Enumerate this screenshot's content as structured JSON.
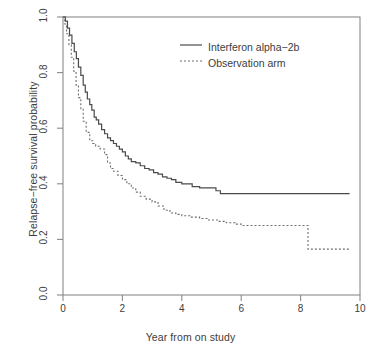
{
  "chart_data": {
    "type": "line",
    "title": "",
    "xlabel": "Year from on study",
    "ylabel": "Relapse-free survival probability",
    "xlim": [
      0,
      10
    ],
    "ylim": [
      0.0,
      1.0
    ],
    "grid": false,
    "step_style": "post",
    "legend_position": "top-center",
    "xticks": [
      0,
      2,
      4,
      6,
      8,
      10
    ],
    "xtick_labels": [
      "0",
      "2",
      "4",
      "6",
      "8",
      "10"
    ],
    "yticks": [
      0.0,
      0.2,
      0.4,
      0.6,
      0.8,
      1.0
    ],
    "ytick_labels": [
      "0.0",
      "0.2",
      "0.4",
      "0.6",
      "0.8",
      "1.0"
    ],
    "series": [
      {
        "name": "Interferon alpha-2b",
        "style": "solid",
        "color": "#4a4a4a",
        "x": [
          0,
          0.08,
          0.15,
          0.22,
          0.3,
          0.38,
          0.45,
          0.52,
          0.6,
          0.68,
          0.75,
          0.82,
          0.9,
          0.97,
          1.05,
          1.12,
          1.2,
          1.3,
          1.4,
          1.5,
          1.6,
          1.7,
          1.8,
          1.9,
          2.0,
          2.1,
          2.2,
          2.3,
          2.45,
          2.6,
          2.75,
          2.9,
          3.05,
          3.2,
          3.35,
          3.5,
          3.65,
          3.8,
          4.0,
          4.2,
          4.35,
          4.6,
          4.9,
          5.15,
          5.3,
          6.0,
          7.0,
          8.0,
          9.0,
          9.65
        ],
        "y": [
          1.0,
          0.985,
          0.96,
          0.935,
          0.905,
          0.875,
          0.85,
          0.82,
          0.79,
          0.755,
          0.73,
          0.705,
          0.685,
          0.665,
          0.64,
          0.63,
          0.615,
          0.595,
          0.58,
          0.565,
          0.555,
          0.545,
          0.535,
          0.525,
          0.515,
          0.5,
          0.49,
          0.48,
          0.475,
          0.465,
          0.455,
          0.45,
          0.44,
          0.435,
          0.425,
          0.42,
          0.415,
          0.405,
          0.4,
          0.4,
          0.39,
          0.385,
          0.385,
          0.375,
          0.365,
          0.365,
          0.365,
          0.365,
          0.365,
          0.365
        ]
      },
      {
        "name": "Observation arm",
        "style": "dashed",
        "color": "#6d6d6d",
        "x": [
          0,
          0.06,
          0.12,
          0.2,
          0.28,
          0.36,
          0.44,
          0.52,
          0.6,
          0.68,
          0.78,
          0.9,
          1.0,
          1.1,
          1.25,
          1.4,
          1.5,
          1.6,
          1.7,
          1.85,
          2.0,
          2.15,
          2.3,
          2.45,
          2.6,
          2.8,
          3.0,
          3.2,
          3.4,
          3.6,
          3.8,
          4.0,
          4.3,
          4.6,
          4.9,
          5.2,
          5.5,
          5.8,
          6.0,
          6.5,
          7.0,
          7.5,
          8.0,
          8.25,
          8.6,
          9.0,
          9.4,
          9.65
        ],
        "y": [
          1.0,
          0.975,
          0.94,
          0.9,
          0.855,
          0.805,
          0.755,
          0.71,
          0.67,
          0.625,
          0.585,
          0.555,
          0.545,
          0.535,
          0.525,
          0.505,
          0.475,
          0.455,
          0.445,
          0.43,
          0.415,
          0.4,
          0.385,
          0.37,
          0.355,
          0.345,
          0.335,
          0.32,
          0.305,
          0.295,
          0.29,
          0.285,
          0.28,
          0.275,
          0.27,
          0.265,
          0.26,
          0.255,
          0.25,
          0.25,
          0.25,
          0.25,
          0.25,
          0.165,
          0.165,
          0.165,
          0.165,
          0.165
        ]
      }
    ]
  },
  "legend": {
    "entries": [
      {
        "label": "Interferon alpha−2b",
        "style": "solid"
      },
      {
        "label": "Observation arm",
        "style": "dashed"
      }
    ]
  },
  "axes": {
    "x_title": "Year from on study",
    "y_title": "Relapse−free survival probability"
  },
  "colors": {
    "axis": "#8a8a8a",
    "text": "#3d3d3d",
    "series_solid": "#4a4a4a",
    "series_dashed": "#6d6d6d",
    "background": "#ffffff"
  }
}
